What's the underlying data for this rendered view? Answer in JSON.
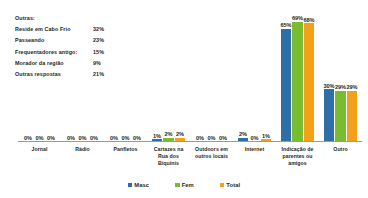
{
  "notes": {
    "title": "Outras:",
    "rows": [
      {
        "label": "Reside em Cabo Frio",
        "value": "32%"
      },
      {
        "label": "Passeando",
        "value": "23%"
      },
      {
        "label": "Frequentadores antigo:",
        "value": "15%"
      },
      {
        "label": "Morador da região",
        "value": "9%"
      },
      {
        "label": "Outras respostas",
        "value": "21%"
      }
    ]
  },
  "colors": {
    "masc": "#2f6fa8",
    "fem": "#79bc2f",
    "total": "#f3a01a",
    "axis": "#9a9a9a",
    "text": "#231f20"
  },
  "legend": {
    "items": [
      {
        "label": "Masc",
        "color": "#2f6fa8"
      },
      {
        "label": "Fem",
        "color": "#79bc2f"
      },
      {
        "label": "Total",
        "color": "#f3a01a"
      }
    ]
  },
  "chart_data": {
    "type": "bar",
    "title": "",
    "xlabel": "",
    "ylabel": "",
    "ylim": [
      0,
      70
    ],
    "grid": false,
    "legend_position": "bottom",
    "categories": [
      "Jornal",
      "Rádio",
      "Panfletos",
      "Cartazes na Rua dos Biquínis",
      "Outdoors em outros locais",
      "Internet",
      "Indicação de parentes ou amigos",
      "Outro"
    ],
    "series": [
      {
        "name": "Masc",
        "color": "#2f6fa8",
        "values": [
          0,
          0,
          0,
          1,
          0,
          2,
          65,
          30
        ],
        "labels": [
          "0%",
          "0%",
          "0%",
          "1%",
          "0%",
          "2%",
          "65%",
          "30%"
        ]
      },
      {
        "name": "Fem",
        "color": "#79bc2f",
        "values": [
          0,
          0,
          0,
          2,
          0,
          0,
          69,
          29
        ],
        "labels": [
          "0%",
          "0%",
          "0%",
          "2%",
          "0%",
          "0%",
          "69%",
          "29%"
        ]
      },
      {
        "name": "Total",
        "color": "#f3a01a",
        "values": [
          0,
          0,
          0,
          2,
          0,
          1,
          68,
          29
        ],
        "labels": [
          "0%",
          "0%",
          "0%",
          "2%",
          "0%",
          "1%",
          "68%",
          "29%"
        ]
      }
    ]
  }
}
